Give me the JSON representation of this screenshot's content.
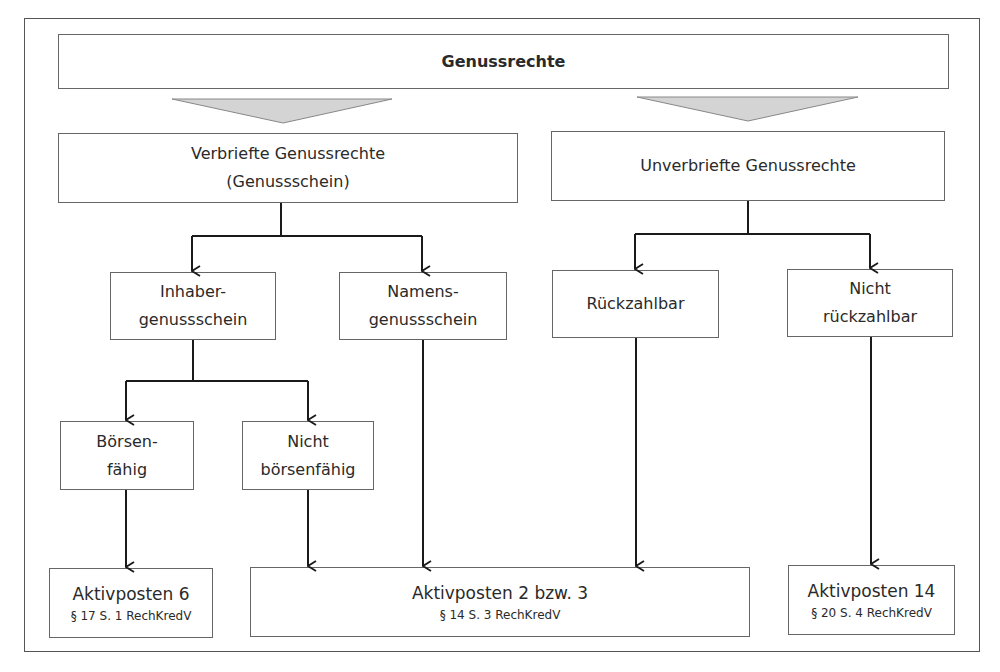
{
  "diagram": {
    "root": {
      "label": "Genussrechte"
    },
    "level1": [
      {
        "id": "verbrieft",
        "lines": [
          "Verbriefte Genussrechte",
          "(Genussschein)"
        ]
      },
      {
        "id": "unverbrieft",
        "lines": [
          "Unverbriefte Genussrechte"
        ]
      }
    ],
    "level2": [
      {
        "id": "inhaber",
        "lines": [
          "Inhaber-",
          "genussschein"
        ]
      },
      {
        "id": "namens",
        "lines": [
          "Namens-",
          "genussschein"
        ]
      },
      {
        "id": "rueckzahlbar",
        "lines": [
          "Rückzahlbar"
        ]
      },
      {
        "id": "nicht_rueckzahlbar",
        "lines": [
          "Nicht",
          "rückzahlbar"
        ]
      }
    ],
    "level3": [
      {
        "id": "boersenfaehig",
        "lines": [
          "Börsen-",
          "fähig"
        ]
      },
      {
        "id": "nicht_boersenfaehig",
        "lines": [
          "Nicht",
          "börsenfähig"
        ]
      }
    ],
    "results": [
      {
        "id": "ap6",
        "title": "Aktivposten 6",
        "ref": "§ 17 S. 1 RechKredV"
      },
      {
        "id": "ap23",
        "title": "Aktivposten 2 bzw. 3",
        "ref": "§ 14 S. 3 RechKredV"
      },
      {
        "id": "ap14",
        "title": "Aktivposten 14",
        "ref": "§ 20 S. 4 RechKredV"
      }
    ],
    "colors": {
      "border": "#666666",
      "arrow": "#1a1a1a",
      "funnel_fill": "#d4d4d4"
    }
  }
}
